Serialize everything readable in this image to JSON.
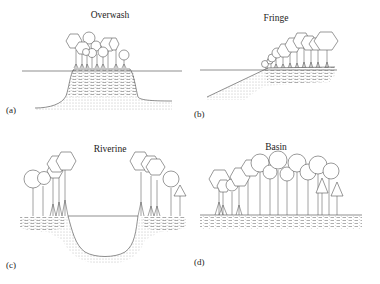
{
  "figure": {
    "panels": [
      {
        "id": "a",
        "title": "Overwash",
        "label": "(a)"
      },
      {
        "id": "b",
        "title": "Fringe",
        "label": "(b)"
      },
      {
        "id": "c",
        "title": "Riverine",
        "label": "(c)"
      },
      {
        "id": "d",
        "title": "Basin",
        "label": "(d)"
      }
    ],
    "colors": {
      "line": "#444444",
      "background": "#ffffff",
      "text": "#222222"
    }
  }
}
